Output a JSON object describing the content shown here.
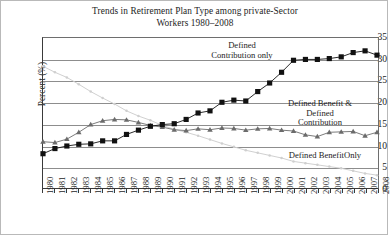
{
  "figure": {
    "title_lines": [
      "Trends in Retirement Plan Type among private-Sector",
      "Workers 1980–2008"
    ],
    "ylabel": "Percent (%)",
    "colors": {
      "defined_contribution_only": "#111111",
      "defined_benefit_and_contribution": "#6b6b6b",
      "defined_benefit_only": "#cfcfcf",
      "axis": "#3a3a3a",
      "grid": "#8d8d8d",
      "background": "#ffffff"
    }
  },
  "annotations": {
    "defined_contribution_only": [
      "Defined",
      "Contribution only"
    ],
    "defined_benefit_and_contribution": [
      "Defined Benefit &",
      "Defined",
      "Contribution"
    ],
    "defined_benefit_only": [
      "Defined BenefitOnly"
    ]
  },
  "chart_data": {
    "type": "line",
    "title": "Trends in Retirement Plan Type among private-Sector Workers 1980–2008",
    "xlabel": "",
    "ylabel": "Percent (%)",
    "ylim": [
      0,
      35
    ],
    "yticks": [
      0,
      5,
      10,
      15,
      20,
      25,
      30,
      35
    ],
    "grid": true,
    "legend_position": "inline-annotations",
    "categories": [
      "1980",
      "1981",
      "1982",
      "1983",
      "1984",
      "1985",
      "1986",
      "1987",
      "1988",
      "1989",
      "1990",
      "1991",
      "1992",
      "1993",
      "1994",
      "1995",
      "1996",
      "1997",
      "1998",
      "1999",
      "2000",
      "2001",
      "2002",
      "2003",
      "2004",
      "2005",
      "2006",
      "2007",
      "2008"
    ],
    "series": [
      {
        "name": "Defined Contribution only",
        "marker": "square",
        "color": "#111111",
        "values": [
          8.0,
          9.2,
          9.8,
          10.2,
          10.3,
          11.0,
          11.0,
          12.5,
          13.5,
          14.4,
          14.8,
          15.0,
          16.0,
          17.5,
          18.0,
          20.0,
          20.5,
          20.3,
          22.5,
          24.5,
          27.0,
          29.8,
          30.0,
          30.0,
          30.2,
          30.6,
          31.6,
          32.0,
          31.0
        ]
      },
      {
        "name": "Defined Benefit & Defined Contribution",
        "marker": "triangle",
        "color": "#6b6b6b",
        "values": [
          10.8,
          10.6,
          11.4,
          13.0,
          14.8,
          15.7,
          16.0,
          15.9,
          15.3,
          14.6,
          14.2,
          13.6,
          13.4,
          13.8,
          13.6,
          14.0,
          13.9,
          13.5,
          13.8,
          13.9,
          13.5,
          13.3,
          12.4,
          12.0,
          13.0,
          13.1,
          13.2,
          12.2,
          13.0
        ]
      },
      {
        "name": "Defined Benefit only",
        "marker": "dot",
        "color": "#cfcfcf",
        "values": [
          28.4,
          27.0,
          25.8,
          24.2,
          22.5,
          21.0,
          19.6,
          18.0,
          16.8,
          15.8,
          14.6,
          13.7,
          13.0,
          12.2,
          11.3,
          10.4,
          9.6,
          8.8,
          8.2,
          7.6,
          7.0,
          6.2,
          5.8,
          5.4,
          5.0,
          4.6,
          4.0,
          3.4,
          3.0
        ]
      }
    ]
  }
}
